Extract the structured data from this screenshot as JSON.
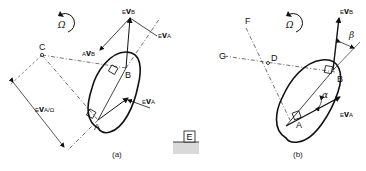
{
  "figure": {
    "panel_a": {
      "caption": "(a)",
      "rotation_symbol": "Ω",
      "points": {
        "A": "A",
        "B": "B",
        "C": "C"
      },
      "vectors": {
        "evb": {
          "pre": "E",
          "main": "v",
          "sub": "B"
        },
        "eva_top": {
          "pre": "E",
          "main": "v",
          "sub": "A"
        },
        "avb": {
          "pre": "A",
          "main": "v",
          "sub": "B"
        },
        "eva_body": {
          "pre": "E",
          "main": "v",
          "sub": "A"
        }
      },
      "dimension_label": {
        "pre": "E",
        "main": "v",
        "sub": "A/Ω"
      }
    },
    "panel_b": {
      "caption": "(b)",
      "rotation_symbol": "Ω",
      "points": {
        "A": "A",
        "B": "B",
        "D": "D",
        "F": "F",
        "G": "G"
      },
      "vectors": {
        "evb": {
          "pre": "E",
          "main": "v",
          "sub": "B"
        },
        "eva": {
          "pre": "E",
          "main": "v",
          "sub": "A"
        }
      },
      "angles": {
        "alpha": "α",
        "beta": "β"
      }
    },
    "ground": {
      "label": "E"
    },
    "colors": {
      "ink": "#111111",
      "ground_fill": "#d9d9d9"
    }
  }
}
